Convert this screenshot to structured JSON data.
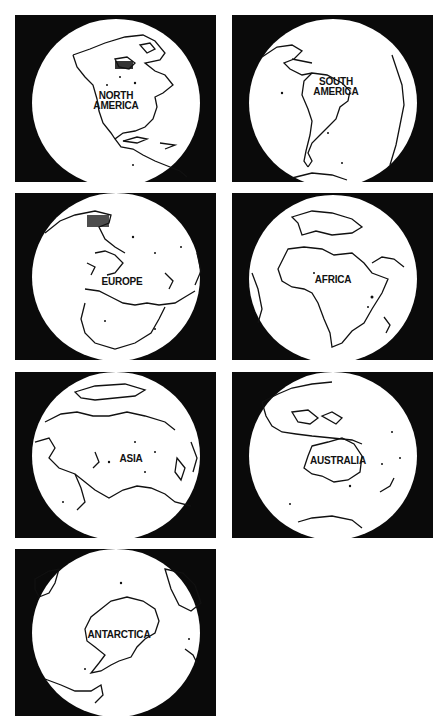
{
  "figure": {
    "background": "#ffffff",
    "panel_color": "#0a0a0a",
    "globe_color": "#ffffff",
    "outline_color": "#111111"
  },
  "panels": [
    {
      "id": "north-america",
      "label": "NORTH\nAMERICA"
    },
    {
      "id": "south-america",
      "label": "SOUTH\nAMERICA"
    },
    {
      "id": "europe",
      "label": "EUROPE"
    },
    {
      "id": "africa",
      "label": "AFRICA"
    },
    {
      "id": "asia",
      "label": "ASIA"
    },
    {
      "id": "australia",
      "label": "AUSTRALIA"
    },
    {
      "id": "antarctica",
      "label": "ANTARCTICA"
    }
  ]
}
